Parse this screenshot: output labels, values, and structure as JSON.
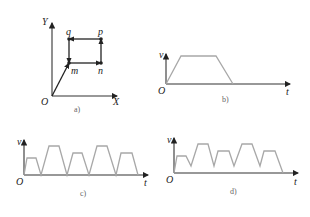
{
  "panels": {
    "a": {
      "caption": "a)",
      "axes": {
        "x_label": "X",
        "y_label": "Y",
        "origin": "O"
      },
      "points": {
        "q": "q",
        "p": "p",
        "m": "m",
        "n": "n"
      },
      "path_description": "O → m → n → p → q → m (rectangular loop with arrows)"
    },
    "b": {
      "caption": "b)",
      "axes": {
        "x_label": "t",
        "y_label": "v",
        "origin": "O"
      },
      "profile": "single trapezoidal velocity profile"
    },
    "c": {
      "caption": "c)",
      "axes": {
        "x_label": "t",
        "y_label": "v",
        "origin": "O"
      },
      "profile": "five trapezoids, each returning to zero velocity"
    },
    "d": {
      "caption": "d)",
      "axes": {
        "x_label": "t",
        "y_label": "v",
        "origin": "O"
      },
      "profile": "five blended trapezoids not returning to zero between segments"
    }
  }
}
